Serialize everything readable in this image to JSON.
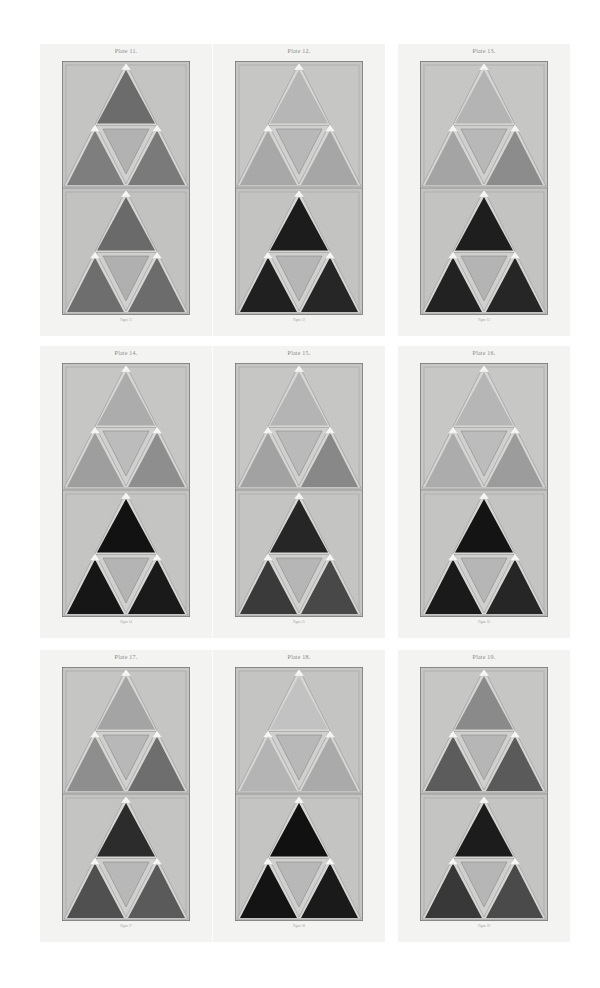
{
  "page": {
    "background": "#ffffff",
    "card_background": "#f3f3f2"
  },
  "plates": [
    {
      "title": "Plate 11.",
      "caption": "Figure 11",
      "x": 40,
      "y": 44,
      "upper": {
        "bg": "#c4c4c3",
        "top": "#6c6c6c",
        "left": "#7e7e7e",
        "right": "#7a7a7a",
        "middle": "#b2b2b2"
      },
      "lower": {
        "bg": "#c2c2c1",
        "top": "#6a6a6a",
        "left": "#6e6e6e",
        "right": "#6c6c6c",
        "middle": "#b0b0b0"
      }
    },
    {
      "title": "Plate 12.",
      "caption": "Figure 12",
      "x": 213,
      "y": 44,
      "upper": {
        "bg": "#c6c6c5",
        "top": "#b6b6b6",
        "left": "#a8a8a8",
        "right": "#a6a6a6",
        "middle": "#b8b8b8"
      },
      "lower": {
        "bg": "#c3c3c2",
        "top": "#1c1c1c",
        "left": "#202020",
        "right": "#262626",
        "middle": "#b6b6b6"
      }
    },
    {
      "title": "Plate 13.",
      "caption": "Figure 13",
      "x": 398,
      "y": 44,
      "upper": {
        "bg": "#c6c6c5",
        "top": "#b4b4b4",
        "left": "#a4a4a4",
        "right": "#8c8c8c",
        "middle": "#b8b8b8"
      },
      "lower": {
        "bg": "#c3c3c2",
        "top": "#1e1e1e",
        "left": "#222222",
        "right": "#262626",
        "middle": "#b4b4b4"
      }
    },
    {
      "title": "Plate 14.",
      "caption": "Figure 14",
      "x": 40,
      "y": 346,
      "upper": {
        "bg": "#c6c6c5",
        "top": "#acacac",
        "left": "#9e9e9e",
        "right": "#8e8e8e",
        "middle": "#bcbcbc"
      },
      "lower": {
        "bg": "#c4c4c3",
        "top": "#121212",
        "left": "#161616",
        "right": "#1a1a1a",
        "middle": "#b4b4b4"
      }
    },
    {
      "title": "Plate 15.",
      "caption": "Figure 15",
      "x": 213,
      "y": 346,
      "upper": {
        "bg": "#c6c6c5",
        "top": "#b4b4b4",
        "left": "#a2a2a2",
        "right": "#888888",
        "middle": "#bababa"
      },
      "lower": {
        "bg": "#c4c4c3",
        "top": "#262626",
        "left": "#3a3a3a",
        "right": "#484848",
        "middle": "#b6b6b6"
      }
    },
    {
      "title": "Plate 16.",
      "caption": "Figure 16",
      "x": 398,
      "y": 346,
      "upper": {
        "bg": "#c7c7c6",
        "top": "#b6b6b6",
        "left": "#acacac",
        "right": "#9c9c9c",
        "middle": "#bcbcbc"
      },
      "lower": {
        "bg": "#c4c4c3",
        "top": "#141414",
        "left": "#1a1a1a",
        "right": "#262626",
        "middle": "#b6b6b6"
      }
    },
    {
      "title": "Plate 17.",
      "caption": "Figure 17",
      "x": 40,
      "y": 650,
      "upper": {
        "bg": "#c5c5c4",
        "top": "#a4a4a4",
        "left": "#8e8e8e",
        "right": "#6e6e6e",
        "middle": "#b8b8b8"
      },
      "lower": {
        "bg": "#c4c4c3",
        "top": "#2c2c2c",
        "left": "#505050",
        "right": "#5a5a5a",
        "middle": "#b8b8b8"
      }
    },
    {
      "title": "Plate 18.",
      "caption": "Figure 18",
      "x": 213,
      "y": 650,
      "upper": {
        "bg": "#c4c4c3",
        "top": "#c2c2c2",
        "left": "#b4b4b4",
        "right": "#aaaaaa",
        "middle": "#b8b8b8"
      },
      "lower": {
        "bg": "#c4c4c3",
        "top": "#111111",
        "left": "#141414",
        "right": "#1a1a1a",
        "middle": "#b8b8b8"
      }
    },
    {
      "title": "Plate 19.",
      "caption": "Figure 19",
      "x": 398,
      "y": 650,
      "upper": {
        "bg": "#c6c6c5",
        "top": "#8a8a8a",
        "left": "#5c5c5c",
        "right": "#5a5a5a",
        "middle": "#b6b6b6"
      },
      "lower": {
        "bg": "#c4c4c3",
        "top": "#1c1c1c",
        "left": "#383838",
        "right": "#4a4a4a",
        "middle": "#b6b6b6"
      }
    }
  ],
  "icons": {
    "vertex_marker": "white-triangle-marker"
  }
}
